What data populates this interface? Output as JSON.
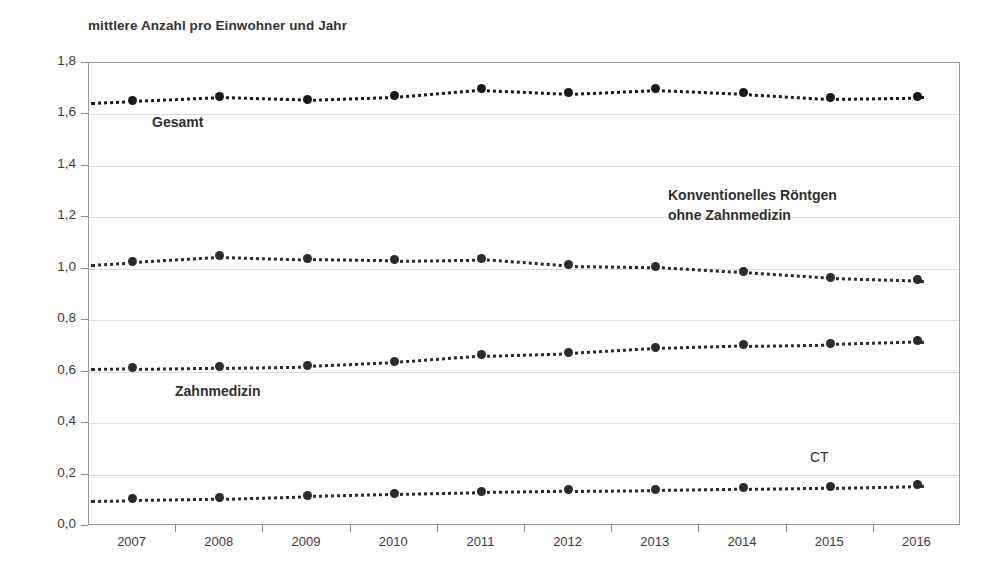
{
  "chart_data": {
    "type": "line",
    "title": "mittlere Anzahl pro Einwohner und Jahr",
    "xlabel": "",
    "ylabel": "mittlere Anzahl pro Einwohner und Jahr",
    "categories": [
      "2007",
      "2008",
      "2009",
      "2010",
      "2011",
      "2012",
      "2013",
      "2014",
      "2015",
      "2016"
    ],
    "ylim": [
      0.0,
      1.8
    ],
    "yticks": [
      "0,0",
      "0,2",
      "0,4",
      "0,6",
      "0,8",
      "1,0",
      "1,2",
      "1,4",
      "1,6",
      "1,8"
    ],
    "ytick_values": [
      0.0,
      0.2,
      0.4,
      0.6,
      0.8,
      1.0,
      1.2,
      1.4,
      1.6,
      1.8
    ],
    "grid": true,
    "legend_position": "inline-annotations",
    "series": [
      {
        "name": "Gesamt",
        "label": "Gesamt",
        "color": "#1a1a1a",
        "values": [
          1.655,
          1.67,
          1.66,
          1.672,
          1.7,
          1.685,
          1.7,
          1.685,
          1.665,
          1.67
        ]
      },
      {
        "name": "Konventionelles Röntgen ohne Zahnmedizin",
        "label": "Konventionelles Röntgen\nohne Zahnmedizin",
        "color": "#2b2b2b",
        "values": [
          1.03,
          1.05,
          1.04,
          1.035,
          1.04,
          1.015,
          1.01,
          0.99,
          0.968,
          0.958
        ]
      },
      {
        "name": "Zahnmedizin",
        "label": "Zahnmedizin",
        "color": "#2b2b2b",
        "values": [
          0.615,
          0.62,
          0.625,
          0.64,
          0.665,
          0.675,
          0.695,
          0.705,
          0.71,
          0.72
        ]
      },
      {
        "name": "CT",
        "label": "CT",
        "color": "#2b2b2b",
        "values": [
          0.105,
          0.11,
          0.12,
          0.128,
          0.135,
          0.14,
          0.143,
          0.148,
          0.153,
          0.16
        ]
      }
    ]
  }
}
